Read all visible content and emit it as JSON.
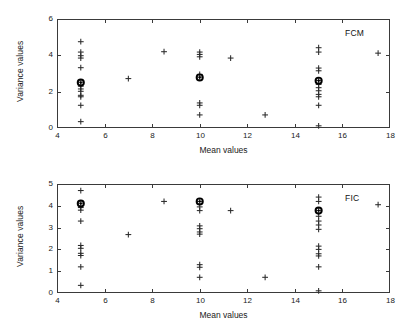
{
  "figure": {
    "background": "#ffffff",
    "axis_color": "#3a3a3a",
    "marker_color": "#2b2b2b",
    "centroid_color": "#000000"
  },
  "chart_data": [
    {
      "type": "scatter",
      "title": "FCM",
      "xlabel": "Mean values",
      "ylabel": "Variance values",
      "xlim": [
        4,
        18
      ],
      "ylim": [
        0,
        6
      ],
      "xticks": [
        4,
        6,
        8,
        10,
        12,
        14,
        16,
        18
      ],
      "yticks": [
        0,
        2,
        4,
        6
      ],
      "xticklabels": [
        "4",
        "6",
        "8",
        "10",
        "12",
        "14",
        "16",
        "18"
      ],
      "yticklabels": [
        "0",
        "2",
        "4",
        "6"
      ],
      "grid": false,
      "legend": "none",
      "series": [
        {
          "name": "data points",
          "marker": "plus",
          "points": [
            [
              5,
              4.75
            ],
            [
              5,
              4.18
            ],
            [
              5,
              3.98
            ],
            [
              5,
              3.85
            ],
            [
              5,
              3.32
            ],
            [
              5,
              2.52
            ],
            [
              5,
              2.3
            ],
            [
              5,
              2.15
            ],
            [
              5,
              2.02
            ],
            [
              5,
              1.8
            ],
            [
              5,
              1.72
            ],
            [
              5,
              1.25
            ],
            [
              5,
              0.35
            ],
            [
              7,
              2.72
            ],
            [
              8.5,
              4.2
            ],
            [
              10,
              4.18
            ],
            [
              10,
              4.05
            ],
            [
              10,
              3.92
            ],
            [
              10,
              2.95
            ],
            [
              10,
              2.8
            ],
            [
              10,
              1.38
            ],
            [
              10,
              1.25
            ],
            [
              10,
              0.72
            ],
            [
              11.3,
              3.85
            ],
            [
              12.75,
              0.72
            ],
            [
              15,
              4.42
            ],
            [
              15,
              4.18
            ],
            [
              15,
              3.3
            ],
            [
              15,
              3.15
            ],
            [
              15,
              2.62
            ],
            [
              15,
              2.4
            ],
            [
              15,
              2.22
            ],
            [
              15,
              2.05
            ],
            [
              15,
              1.85
            ],
            [
              15,
              1.72
            ],
            [
              15,
              1.25
            ],
            [
              15,
              0.12
            ],
            [
              17.5,
              4.12
            ]
          ]
        },
        {
          "name": "cluster centers",
          "marker": "circle-filled",
          "points": [
            [
              5,
              2.5
            ],
            [
              10,
              2.78
            ],
            [
              15,
              2.6
            ]
          ]
        }
      ]
    },
    {
      "type": "scatter",
      "title": "FIC",
      "xlabel": "Mean values",
      "ylabel": "Variance values",
      "xlim": [
        4,
        18
      ],
      "ylim": [
        0,
        5
      ],
      "xticks": [
        4,
        6,
        8,
        10,
        12,
        14,
        16,
        18
      ],
      "yticks": [
        0,
        1,
        2,
        3,
        4,
        5
      ],
      "xticklabels": [
        "4",
        "6",
        "8",
        "10",
        "12",
        "14",
        "16",
        "18"
      ],
      "yticklabels": [
        "0",
        "1",
        "2",
        "3",
        "4",
        "5"
      ],
      "grid": false,
      "legend": "none",
      "series": [
        {
          "name": "data points",
          "marker": "plus",
          "points": [
            [
              5,
              4.7
            ],
            [
              5,
              4.12
            ],
            [
              5,
              3.92
            ],
            [
              5,
              3.8
            ],
            [
              5,
              3.3
            ],
            [
              5,
              2.18
            ],
            [
              5,
              2.05
            ],
            [
              5,
              1.82
            ],
            [
              5,
              1.72
            ],
            [
              5,
              1.2
            ],
            [
              5,
              0.35
            ],
            [
              7,
              2.68
            ],
            [
              8.5,
              4.2
            ],
            [
              10,
              4.2
            ],
            [
              10,
              3.95
            ],
            [
              10,
              3.78
            ],
            [
              10,
              3.08
            ],
            [
              10,
              2.95
            ],
            [
              10,
              2.8
            ],
            [
              10,
              2.7
            ],
            [
              10,
              1.3
            ],
            [
              10,
              1.18
            ],
            [
              10,
              0.72
            ],
            [
              11.3,
              3.78
            ],
            [
              12.75,
              0.72
            ],
            [
              15,
              4.4
            ],
            [
              15,
              4.2
            ],
            [
              15,
              3.78
            ],
            [
              15,
              3.52
            ],
            [
              15,
              3.3
            ],
            [
              15,
              3.12
            ],
            [
              15,
              2.92
            ],
            [
              15,
              2.15
            ],
            [
              15,
              2.0
            ],
            [
              15,
              1.8
            ],
            [
              15,
              1.7
            ],
            [
              15,
              1.2
            ],
            [
              15,
              0.1
            ],
            [
              17.5,
              4.05
            ]
          ]
        },
        {
          "name": "cluster centers",
          "marker": "circle-filled",
          "points": [
            [
              5,
              4.1
            ],
            [
              10,
              4.2
            ],
            [
              15,
              3.78
            ]
          ]
        }
      ]
    }
  ]
}
